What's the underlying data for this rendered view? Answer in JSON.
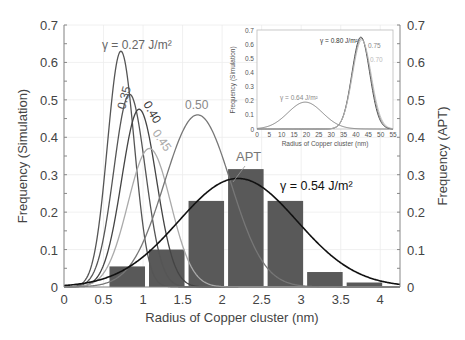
{
  "chart_data": {
    "type": "bar+line",
    "title": "",
    "xlabel": "Radius of Copper cluster (nm)",
    "ylabel_left": "Frequency (Simulation)",
    "ylabel_right": "Frequency (APT)",
    "xlim": [
      0,
      4.25
    ],
    "ylim": [
      0,
      0.7
    ],
    "x_ticks": [
      "0",
      "0.5",
      "1",
      "1.5",
      "2",
      "2.5",
      "3",
      "3.5",
      "4"
    ],
    "y_ticks": [
      "0",
      "0.1",
      "0.2",
      "0.3",
      "0.4",
      "0.5",
      "0.6",
      "0.7"
    ],
    "grid": true,
    "histogram": {
      "name": "APT",
      "label": "APT",
      "color": "#595959",
      "bin_edges": [
        0.55,
        1.05,
        1.55,
        2.05,
        2.55,
        3.05,
        3.55,
        4.05
      ],
      "values": [
        0.055,
        0.1,
        0.23,
        0.315,
        0.23,
        0.04,
        0.012
      ]
    },
    "series": [
      {
        "name": "γ = 0.27 J/m²",
        "label": "γ = 0.27 J/m²",
        "peak_x": 0.72,
        "peak_y": 0.63,
        "sigma": 0.17,
        "color": "#555555"
      },
      {
        "name": "0.35",
        "label": "0.35",
        "peak_x": 0.83,
        "peak_y": 0.515,
        "sigma": 0.2,
        "color": "#555555"
      },
      {
        "name": "0.40",
        "label": "0.40",
        "peak_x": 0.95,
        "peak_y": 0.475,
        "sigma": 0.22,
        "color": "#444444"
      },
      {
        "name": "0.45",
        "label": "0.45",
        "peak_x": 1.08,
        "peak_y": 0.37,
        "sigma": 0.27,
        "color": "#aaaaaa"
      },
      {
        "name": "0.50",
        "label": "0.50",
        "peak_x": 1.69,
        "peak_y": 0.46,
        "sigma": 0.42,
        "color": "#777777"
      },
      {
        "name": "γ = 0.54 J/m²",
        "label": "γ = 0.54 J/m²",
        "peak_x": 2.2,
        "peak_y": 0.29,
        "sigma": 0.75,
        "color": "#111111"
      }
    ],
    "inset": {
      "xlabel": "Radius of Copper cluster (nm)",
      "ylabel": "Frequency (Simulation)",
      "xlim": [
        0,
        55
      ],
      "ylim": [
        0,
        0.7
      ],
      "x_ticks": [
        "0",
        "5",
        "10",
        "15",
        "20",
        "25",
        "30",
        "35",
        "40",
        "45",
        "50",
        "55"
      ],
      "y_ticks": [
        "0",
        "0.1",
        "0.2",
        "0.3",
        "0.4",
        "0.5",
        "0.6",
        "0.7"
      ],
      "series": [
        {
          "name": "γ = 0.64 J/m²",
          "label": "γ = 0.64 J/m²",
          "peak_x": 19.5,
          "peak_y": 0.19,
          "sigma": 7.0,
          "color": "#777777"
        },
        {
          "name": "γ = 0.80 J/m²",
          "label": "γ = 0.80 J/m²",
          "peak_x": 42.0,
          "peak_y": 0.65,
          "sigma": 3.6,
          "color": "#333333"
        },
        {
          "name": "0.75",
          "label": "0.75",
          "peak_x": 42.2,
          "peak_y": 0.64,
          "sigma": 3.7,
          "color": "#888888"
        },
        {
          "name": "0.70",
          "label": "0.70",
          "peak_x": 42.4,
          "peak_y": 0.63,
          "sigma": 3.8,
          "color": "#bbbbbb"
        }
      ]
    }
  }
}
